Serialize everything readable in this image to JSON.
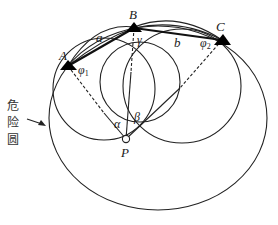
{
  "diagram": {
    "title": "",
    "colors": {
      "stroke": "#222222",
      "background": "#ffffff",
      "marker": "#000000"
    },
    "points": [
      {
        "id": "A",
        "label": "A",
        "x": 68,
        "y": 66
      },
      {
        "id": "B",
        "label": "B",
        "x": 134,
        "y": 28
      },
      {
        "id": "C",
        "label": "C",
        "x": 222,
        "y": 40
      },
      {
        "id": "P",
        "label": "P",
        "x": 126,
        "y": 139
      }
    ],
    "segments": [
      {
        "from": "A",
        "to": "B",
        "label": "a",
        "style": "thick"
      },
      {
        "from": "B",
        "to": "C",
        "label": "b",
        "style": "thick"
      },
      {
        "from": "A",
        "to": "P",
        "style": "dashed-solid"
      },
      {
        "from": "B",
        "to": "P",
        "style": "dashed-solid"
      },
      {
        "from": "C",
        "to": "P",
        "style": "dashed-solid"
      }
    ],
    "angles": {
      "alpha": "α",
      "beta": "β",
      "gamma": "γ",
      "phi1": "φ",
      "phi1_sub": "1",
      "phi2": "φ",
      "phi2_sub": "2"
    },
    "labels": {
      "A": "A",
      "B": "B",
      "C": "C",
      "P": "P",
      "a": "a",
      "b": "b"
    },
    "danger_circle": {
      "label_chars": [
        "危",
        "险",
        "圆"
      ],
      "arrow": "arrow-right"
    }
  }
}
